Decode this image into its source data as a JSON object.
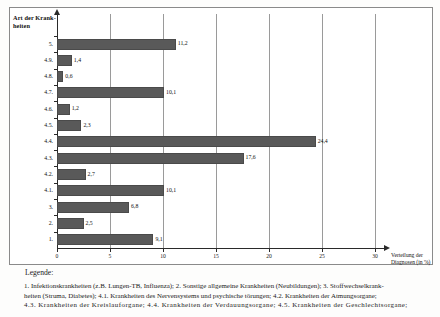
{
  "chart_data": {
    "type": "bar",
    "orientation": "horizontal",
    "title": "",
    "ylabel": "Art der Krank-\nheiten",
    "ylabel_lines": [
      "Art der Krank-",
      "heiten"
    ],
    "xlabel": "Verteilung der Diagnosen (in %)",
    "xlabel_lines": [
      "Verteilung der",
      "Diagnosen (in %)"
    ],
    "xlim": [
      0,
      30
    ],
    "xticks": [
      0,
      5,
      10,
      15,
      20,
      25,
      30
    ],
    "xticklabels": [
      "0",
      "5",
      "10",
      "15",
      "20",
      "25",
      "30"
    ],
    "grid": "vertical",
    "legend_position": "none",
    "categories": [
      "5.",
      "4.9.",
      "4.8.",
      "4.7.",
      "4.6.",
      "4.5.",
      "4.4.",
      "4.3.",
      "4.2.",
      "4.1.",
      "3.",
      "2.",
      "1."
    ],
    "values": [
      11.2,
      1.4,
      0.6,
      10.1,
      1.2,
      2.3,
      24.4,
      17.6,
      2.7,
      10.1,
      6.8,
      2.5,
      9.1
    ],
    "value_labels": [
      "11,2",
      "1,4",
      "0,6",
      "10,1",
      "1,2",
      "2,3",
      "24,4",
      "17,6",
      "2,7",
      "10,1",
      "6,8",
      "2,5",
      "9,1"
    ],
    "bar_color": "#595959"
  },
  "legend": {
    "title": "Legende:",
    "line1": "1. Infektionskrankheiten (z.B. Lungen-TB, Influenza); 2. Sonstige allgemeine Krankheiten (Neubildungen); 3. Stoffwechselkrank-",
    "line2": "heiten (Struma, Diabetes); 4.1. Krankheiten des Nervensystems und psychische törungen; 4.2. Krankheiten der Atmungsorgane;",
    "line3": "4.3. Krankheiten der Kreislauforgane; 4.4. Krankheiten der Verdauungsorgane; 4.5. Krankheiten der Geschlechtsorgane;"
  }
}
